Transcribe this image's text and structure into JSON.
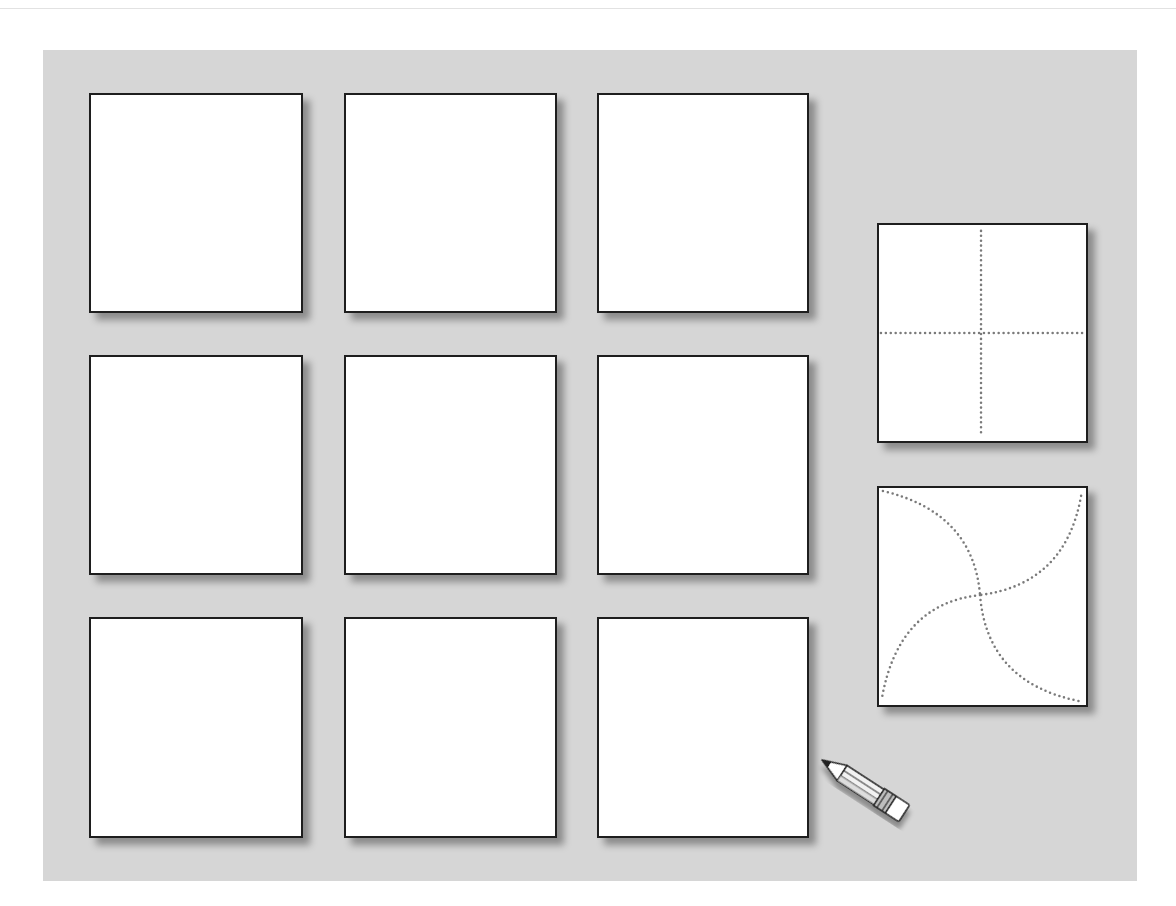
{
  "page": {
    "header_partial_text": "",
    "background_color": "#ffffff",
    "panel_color": "#d6d6d6"
  },
  "grid": {
    "rows": 3,
    "columns": 3,
    "cards": [
      {
        "row": 1,
        "col": 1,
        "content": "blank"
      },
      {
        "row": 1,
        "col": 2,
        "content": "blank"
      },
      {
        "row": 1,
        "col": 3,
        "content": "blank"
      },
      {
        "row": 2,
        "col": 1,
        "content": "blank"
      },
      {
        "row": 2,
        "col": 2,
        "content": "blank"
      },
      {
        "row": 2,
        "col": 3,
        "content": "blank"
      },
      {
        "row": 3,
        "col": 1,
        "content": "blank"
      },
      {
        "row": 3,
        "col": 2,
        "content": "blank"
      },
      {
        "row": 3,
        "col": 3,
        "content": "blank"
      }
    ]
  },
  "examples": [
    {
      "name": "fold-guide-cross",
      "description": "dotted vertical and horizontal center lines"
    },
    {
      "name": "fold-guide-pinwheel",
      "description": "four dotted arcs forming a pinwheel"
    }
  ],
  "decorations": {
    "pencil_icon": "pencil-icon",
    "dot_color": "#7a7a7a",
    "border_color": "#1e1e1e"
  }
}
